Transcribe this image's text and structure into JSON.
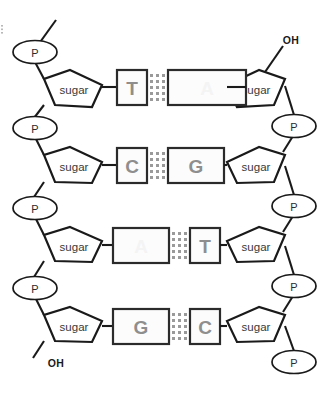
{
  "figure": {
    "width": 329,
    "height": 397,
    "background_color": "#ffffff",
    "line_color": "#1a1a1a",
    "base_letter_color": "#8e8e8e",
    "hydrogen_bond_color": "#9a9a9a"
  },
  "labels": {
    "phosphate": "P",
    "sugar": "sugar",
    "hydroxyl": "OH"
  },
  "terminals": [
    {
      "name": "top-right-hydroxyl",
      "text": "OH"
    },
    {
      "name": "bottom-left-hydroxyl",
      "text": "OH"
    }
  ],
  "base_pairs": [
    {
      "row": 1,
      "left_base": "T",
      "right_base": "A",
      "right_base_visible": false,
      "hydrogen_bonds": 2,
      "left_box_width": 30,
      "right_box_width": 78
    },
    {
      "row": 2,
      "left_base": "C",
      "right_base": "G",
      "right_base_visible": true,
      "hydrogen_bonds": 3,
      "left_box_width": 30,
      "right_box_width": 56
    },
    {
      "row": 3,
      "left_base": "A",
      "right_base": "T",
      "left_base_visible": false,
      "hydrogen_bonds": 2,
      "left_box_width": 56,
      "right_box_width": 30
    },
    {
      "row": 4,
      "left_base": "G",
      "right_base": "C",
      "hydrogen_bonds": 3,
      "left_box_width": 56,
      "right_box_width": 30
    }
  ],
  "left_strand": {
    "name": "left-strand",
    "direction": "5-prime-top",
    "phosphate_count": 4,
    "sugar_count": 4
  },
  "right_strand": {
    "name": "right-strand",
    "direction": "3-prime-top",
    "phosphate_count": 4,
    "sugar_count": 4
  }
}
